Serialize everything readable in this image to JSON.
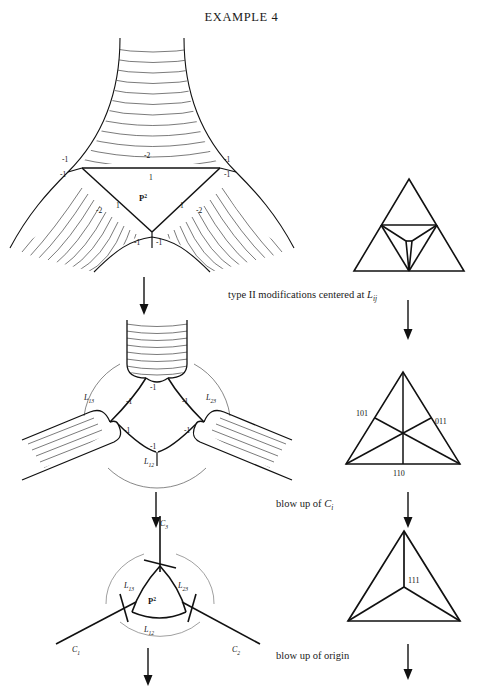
{
  "title": "EXAMPLE 4",
  "figure": {
    "top_left": {
      "name": "three-armed hatched surface with central P2 triangle",
      "center_label": "P",
      "center_label_sup": "2",
      "numbers": {
        "top_left": "-1",
        "top_mid": "-2",
        "top_right": "-1",
        "inner_left": "-1",
        "inner_mid": "1",
        "inner_right": "-1",
        "left_arm": "-2",
        "left_arm_inner": "1",
        "right_arm": "-2",
        "right_arm_inner": "1",
        "bottom_left": "-1",
        "bottom_right": "-1"
      }
    },
    "top_right": {
      "name": "triangle with inner inverted triangle subdivision"
    },
    "mid_left": {
      "name": "three-armed surface after type II modification",
      "labels": {
        "l13": "L",
        "l13_sub": "13",
        "l23": "L",
        "l23_sub": "23",
        "l12": "L",
        "l12_sub": "12"
      },
      "numbers": {
        "top": "-1",
        "upper_left": "-1",
        "upper_right": "-1",
        "lower_left": "-1",
        "lower_right": "-1",
        "bottom": "-1"
      }
    },
    "mid_right": {
      "name": "triangle with medians and barycentric labels",
      "labels": {
        "left": "101",
        "right": "011",
        "bottom": "110"
      }
    },
    "bottom_left": {
      "name": "three curves C1 C2 C3 meeting at P2 region",
      "labels": {
        "c1": "C",
        "c1_sub": "1",
        "c2": "C",
        "c2_sub": "2",
        "c3": "C",
        "c3_sub": "3",
        "l13": "L",
        "l13_sub": "13",
        "l23": "L",
        "l23_sub": "23",
        "l12": "L",
        "l12_sub": "12",
        "center": "P",
        "center_sup": "2"
      }
    },
    "bottom_right": {
      "name": "triangle subdivided at barycenter",
      "labels": {
        "center": "111"
      }
    }
  },
  "captions": {
    "type_ii": "type II modifications centered at ",
    "type_ii_var": "L",
    "type_ii_sub": "ij",
    "blow_up_c": "blow up of ",
    "blow_up_c_var": "C",
    "blow_up_c_sub": "i",
    "blow_up_origin": "blow up of origin"
  },
  "colors": {
    "ink": "#111111",
    "hatch": "#333333",
    "paper": "#ffffff"
  }
}
